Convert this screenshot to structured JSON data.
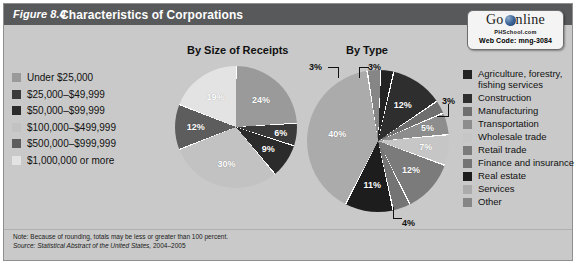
{
  "figure": {
    "number": "Figure 8.4",
    "title": "Characteristics of Corporations"
  },
  "go_online": {
    "brand_go": "Go",
    "brand_online": "nline",
    "site": "PHSchool.com",
    "web_code": "Web Code: mng-3084",
    "globe_icon": "globe-icon"
  },
  "charts": [
    {
      "id": "by-size-of-receipts",
      "title": "By Size of Receipts"
    },
    {
      "id": "by-type",
      "title": "By Type"
    }
  ],
  "legend_left": {
    "items": [
      {
        "label": "Under $25,000",
        "color": "#9a9a9a"
      },
      {
        "label": "$25,000–$49,999",
        "color": "#3a3a3a"
      },
      {
        "label": "$50,000–$99,999",
        "color": "#2b2b2b"
      },
      {
        "label": "$100,000–$499,999",
        "color": "#c2c2c2"
      },
      {
        "label": "$500,000–$999,999",
        "color": "#5d5d5d"
      },
      {
        "label": "$1,000,000 or more",
        "color": "#e3e3e3"
      }
    ]
  },
  "legend_right": {
    "items": [
      {
        "label": "Agriculture, forestry,\nfishing services",
        "color": "#232323"
      },
      {
        "label": "Construction",
        "color": "#2e2e2e"
      },
      {
        "label": "Manufacturing",
        "color": "#6f6f6f"
      },
      {
        "label": "Transportation",
        "color": "#8d8d8d"
      },
      {
        "label": "Wholesale trade",
        "color": "#c6c6c6"
      },
      {
        "label": "Retail trade",
        "color": "#7b7b7b"
      },
      {
        "label": "Finance and insurance",
        "color": "#747474"
      },
      {
        "label": "Real estate",
        "color": "#1d1d1d"
      },
      {
        "label": "Services",
        "color": "#ababab"
      },
      {
        "label": "Other",
        "color": "#868686"
      }
    ]
  },
  "note": {
    "line1": "Note: Because of rounding, totals may be less or greater than 100 percent.",
    "source_label": "Source:",
    "source_italic": "Statistical Abstract of the United States,",
    "source_year": "2004–2005"
  },
  "chart_data": [
    {
      "type": "pie",
      "title": "By Size of Receipts",
      "xlabel": "",
      "ylabel": "",
      "legend_position": "left",
      "categories": [
        "Under $25,000",
        "$25,000–$49,999",
        "$50,000–$99,999",
        "$100,000–$499,999",
        "$500,000–$999,999",
        "$1,000,000 or more"
      ],
      "values": [
        24,
        6,
        9,
        30,
        12,
        19
      ],
      "labels": [
        "24%",
        "6%",
        "9%",
        "30%",
        "12%",
        "19%"
      ],
      "colors": [
        "#9a9a9a",
        "#3a3a3a",
        "#2b2b2b",
        "#c2c2c2",
        "#5d5d5d",
        "#e3e3e3"
      ]
    },
    {
      "type": "pie",
      "title": "By Type",
      "xlabel": "",
      "ylabel": "",
      "legend_position": "right",
      "categories": [
        "Agriculture, forestry, fishing services",
        "Construction",
        "Manufacturing",
        "Transportation",
        "Wholesale trade",
        "Retail trade",
        "Finance and insurance",
        "Real estate",
        "Services",
        "Other"
      ],
      "values": [
        3,
        12,
        3,
        5,
        7,
        12,
        4,
        11,
        40,
        3
      ],
      "labels": [
        "3%",
        "12%",
        "3%",
        "5%",
        "7%",
        "12%",
        "4%",
        "11%",
        "40%",
        "3%"
      ],
      "colors": [
        "#232323",
        "#2e2e2e",
        "#6f6f6f",
        "#8d8d8d",
        "#c6c6c6",
        "#7b7b7b",
        "#747474",
        "#1d1d1d",
        "#ababab",
        "#868686"
      ]
    }
  ]
}
